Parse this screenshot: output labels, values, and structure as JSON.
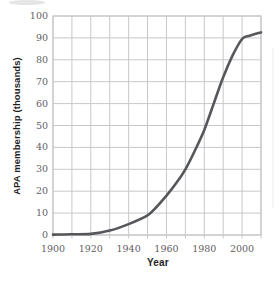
{
  "chart_data": {
    "type": "line",
    "title": "",
    "xlabel": "Year",
    "ylabel": "APA membership (thousands)",
    "x_range": [
      1900,
      2010
    ],
    "y_range": [
      0,
      100
    ],
    "x_grid_step": 10,
    "y_grid_step": 10,
    "x_tick_labels": [
      "1900",
      "1920",
      "1940",
      "1960",
      "1980",
      "2000"
    ],
    "x_tick_values": [
      1900,
      1920,
      1940,
      1960,
      1980,
      2000
    ],
    "y_tick_values": [
      0,
      10,
      20,
      30,
      40,
      50,
      60,
      70,
      80,
      90,
      100
    ],
    "grid": true,
    "legend_position": "none",
    "series": [
      {
        "name": "APA membership",
        "points": [
          [
            1900,
            0.2
          ],
          [
            1910,
            0.3
          ],
          [
            1920,
            0.5
          ],
          [
            1930,
            2
          ],
          [
            1940,
            5
          ],
          [
            1950,
            9
          ],
          [
            1955,
            13
          ],
          [
            1960,
            18
          ],
          [
            1965,
            23.5
          ],
          [
            1970,
            30
          ],
          [
            1975,
            38.5
          ],
          [
            1980,
            48
          ],
          [
            1985,
            60
          ],
          [
            1990,
            72
          ],
          [
            1995,
            82
          ],
          [
            2000,
            89.5
          ],
          [
            2004,
            91
          ],
          [
            2010,
            92.5
          ]
        ]
      }
    ],
    "colors": {
      "line": "#56575a",
      "grid": "#c7c8ca",
      "tick_text": "#5f6063",
      "axis_title": "#1f1d1e",
      "background": "#ffffff"
    }
  }
}
